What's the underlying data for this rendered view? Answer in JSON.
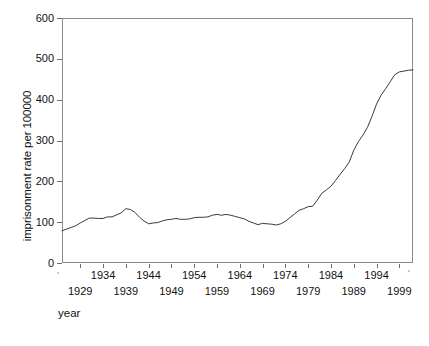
{
  "chart_data": {
    "type": "line",
    "title": "",
    "xlabel": "year",
    "ylabel": "imprisonment rate per 100000",
    "xlim": [
      1925,
      2002
    ],
    "ylim": [
      0,
      600
    ],
    "grid": false,
    "legend": null,
    "y_ticks": [
      0,
      100,
      200,
      300,
      400,
      500,
      600
    ],
    "x_ticks_upper": [
      1934,
      1944,
      1954,
      1964,
      1974,
      1984,
      1994
    ],
    "x_ticks_lower": [
      1929,
      1939,
      1949,
      1959,
      1969,
      1979,
      1989,
      1999
    ],
    "series": [
      {
        "name": "imprisonment rate per 100000",
        "color": "#3a3a3a",
        "x": [
          1925,
          1926,
          1927,
          1928,
          1929,
          1930,
          1931,
          1932,
          1933,
          1934,
          1935,
          1936,
          1937,
          1938,
          1939,
          1940,
          1941,
          1942,
          1943,
          1944,
          1945,
          1946,
          1947,
          1948,
          1949,
          1950,
          1951,
          1952,
          1953,
          1954,
          1955,
          1956,
          1957,
          1958,
          1959,
          1960,
          1961,
          1962,
          1963,
          1964,
          1965,
          1966,
          1967,
          1968,
          1969,
          1970,
          1971,
          1972,
          1973,
          1974,
          1975,
          1976,
          1977,
          1978,
          1979,
          1980,
          1981,
          1982,
          1983,
          1984,
          1985,
          1986,
          1987,
          1988,
          1989,
          1990,
          1991,
          1992,
          1993,
          1994,
          1995,
          1996,
          1997,
          1998,
          1999,
          2000,
          2001,
          2002
        ],
        "y": [
          79,
          83,
          87,
          91,
          98,
          104,
          110,
          110,
          109,
          109,
          113,
          113,
          118,
          123,
          133,
          131,
          124,
          112,
          103,
          96,
          98,
          99,
          103,
          106,
          107,
          109,
          107,
          107,
          108,
          111,
          112,
          112,
          113,
          117,
          119,
          117,
          119,
          117,
          114,
          111,
          108,
          102,
          98,
          94,
          97,
          96,
          95,
          93,
          96,
          102,
          111,
          120,
          129,
          133,
          138,
          139,
          154,
          171,
          179,
          188,
          202,
          217,
          231,
          247,
          276,
          297,
          313,
          332,
          359,
          389,
          411,
          427,
          444,
          461,
          468,
          470,
          472,
          473
        ],
        "start_value": 79,
        "peak_1939": 133,
        "trough_1944": 96,
        "trough_1972": 93,
        "end_value": 473
      }
    ]
  },
  "axes": {
    "y_title": "imprisonment rate per 100000",
    "x_title": "year"
  }
}
